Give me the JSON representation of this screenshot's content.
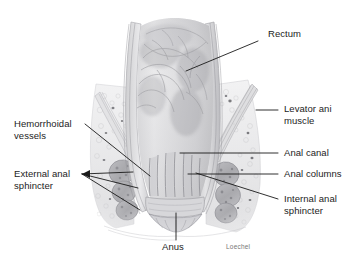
{
  "figure": {
    "signature": "Loechel",
    "background_color": "#ffffff",
    "line_color": "#1a1a1a",
    "text_color": "#1c1c1c",
    "signature_color": "#777676",
    "tissue_color": "#b9b9bb"
  },
  "labels": {
    "rectum": "Rectum",
    "levator_ani_muscle": "Levator ani\nmuscle",
    "anal_canal": "Anal canal",
    "anal_columns": "Anal columns",
    "internal_anal_sphincter": "Internal anal\nsphincter",
    "hemorrhoidal_vessels": "Hemorrhoidal\nvessels",
    "external_anal_sphincter": "External anal\nsphincter",
    "anus": "Anus"
  }
}
